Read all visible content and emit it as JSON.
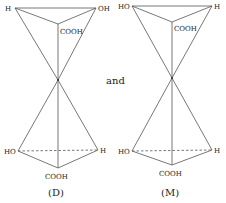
{
  "diagram": {
    "connector_text": "and",
    "molecules": [
      {
        "caption": "(D)",
        "top": {
          "left_label": "H",
          "right_label": "OH",
          "center_label": "COOH"
        },
        "bottom": {
          "left_label": "HO",
          "right_label": "H",
          "center_label": "COOH"
        }
      },
      {
        "caption": "(M)",
        "top": {
          "left_label": "HO",
          "right_label": "H",
          "center_label": "COOH"
        },
        "bottom": {
          "left_label": "HO",
          "right_label": "H",
          "center_label": "COOH"
        }
      }
    ],
    "colors": {
      "line": "#555555",
      "text": "#222222"
    }
  }
}
